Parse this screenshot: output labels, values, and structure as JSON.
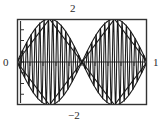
{
  "figure": {
    "name": "amplitude-modulated-waveform-plot",
    "frame": {
      "x": 17,
      "y": 19,
      "width": 130,
      "height": 86
    },
    "frame_color": "#333333",
    "trace_color": "#1a1a1a",
    "background": "#ffffff"
  },
  "labels": {
    "top": "2",
    "bottom": "−2",
    "left": "0",
    "right": "1"
  },
  "chart_data": {
    "type": "line",
    "title": "",
    "xlabel": "",
    "ylabel": "",
    "xlim": [
      0,
      1
    ],
    "ylim": [
      -2,
      2
    ],
    "xtick_labels": [
      "0",
      "1"
    ],
    "ytick_labels": [
      "2",
      "-2"
    ],
    "xticks": [
      0,
      1
    ],
    "yticks": [
      -2,
      2
    ],
    "grid": false,
    "legend": null,
    "axis_tick_count_x": 10,
    "axis_tick_count_y": 8,
    "series": [
      {
        "name": "carrier",
        "formula": "2*sin(2*pi*x)*sin(60*pi*x)",
        "envelope_lobes": 2,
        "carrier_cycles": 30,
        "amplitude": 2
      },
      {
        "name": "envelope-upper-sine",
        "formula": "2*|sin(2*pi*x)|",
        "amplitude": 2
      },
      {
        "name": "envelope-lower-sine",
        "formula": "-2*|sin(2*pi*x)|",
        "amplitude": 2
      },
      {
        "name": "envelope-upper-linear",
        "formula": "triangle wave, peak 2",
        "amplitude": 2
      },
      {
        "name": "envelope-lower-linear",
        "formula": "triangle wave, peak -2",
        "amplitude": 2
      }
    ],
    "x": [
      0,
      0.125,
      0.25,
      0.375,
      0.5,
      0.625,
      0.75,
      0.875,
      1
    ],
    "envelope_upper_values": [
      0,
      1.41,
      2,
      1.41,
      0,
      1.41,
      2,
      1.41,
      0
    ],
    "envelope_lower_values": [
      0,
      -1.41,
      -2,
      -1.41,
      0,
      -1.41,
      -2,
      -1.41,
      0
    ]
  }
}
